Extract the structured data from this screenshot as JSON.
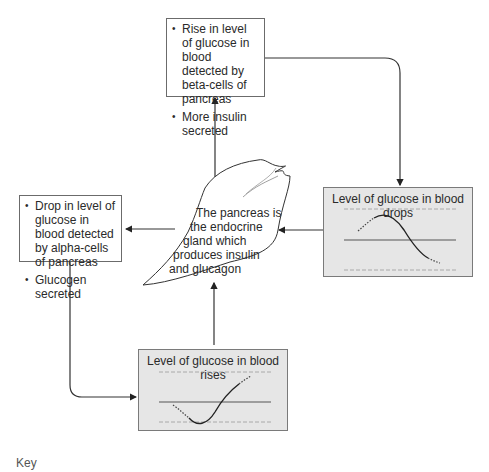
{
  "boxes": {
    "top": {
      "items": [
        "Rise in level of glucose in blood detected by beta-cells of pancreas",
        "More insulin secreted"
      ]
    },
    "left": {
      "items": [
        "Drop in level of glucose in blood detected by alpha-cells of pancreas",
        "Glucogen secreted"
      ]
    }
  },
  "pancreas": {
    "label": "The pancreas is the endocrine gland which produces insulin and glucagon",
    "lines": [
      "The pancreas is",
      "the endocrine",
      "gland which",
      "produces insulin",
      "and glucagon"
    ]
  },
  "graphs": {
    "drops": {
      "title": "Level of glucose in blood drops"
    },
    "rises": {
      "title": "Level of glucose in blood rises"
    }
  },
  "key": {
    "label": "Key"
  },
  "colors": {
    "graph_bg": "#e6e6e6",
    "line": "#333333",
    "dash": "#9a9a9a"
  }
}
